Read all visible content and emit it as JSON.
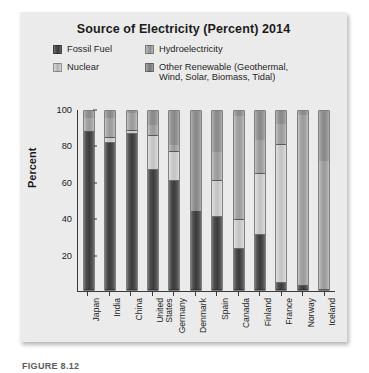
{
  "figure": {
    "caption_fragment": "FIGURE 8.12"
  },
  "chart_data": {
    "type": "bar",
    "subtype": "stacked-bar",
    "title": "Source of Electricity (Percent) 2014",
    "xlabel": "",
    "ylabel": "Percent",
    "ylim": [
      0,
      100
    ],
    "yticks": [
      20,
      40,
      60,
      80,
      100
    ],
    "ytick_labels": [
      "20",
      "40",
      "60",
      "80",
      "100"
    ],
    "grid": false,
    "legend_position": "top",
    "categories": [
      "Japan",
      "India",
      "China",
      "United\nStates",
      "Germany",
      "Denmark",
      "Spain",
      "Canada",
      "Finland",
      "France",
      "Norway",
      "Iceland"
    ],
    "series": [
      {
        "name": "Fossil Fuel",
        "color": "#3f3f3f",
        "values": [
          88,
          82,
          87,
          67,
          61,
          44,
          41,
          23,
          31,
          4,
          2,
          0
        ]
      },
      {
        "name": "Nuclear",
        "color": "#c7c7c7",
        "values": [
          0,
          3,
          2,
          19,
          16,
          0,
          20,
          16,
          34,
          77,
          0,
          0
        ]
      },
      {
        "name": "Hydroelectricity",
        "color": "#9e9e9e",
        "values": [
          8,
          11,
          10,
          6,
          4,
          0,
          16,
          58,
          19,
          12,
          96,
          72
        ]
      },
      {
        "name": "Other Renewable (Geothermal, Wind, Solar, Biomass, Tidal)",
        "color": "#8b8b8b",
        "values": [
          4,
          4,
          1,
          8,
          19,
          56,
          23,
          3,
          16,
          7,
          2,
          28
        ]
      }
    ],
    "legend": [
      {
        "label": "Fossil Fuel",
        "swatch": "sw-fossil"
      },
      {
        "label": "Nuclear",
        "swatch": "sw-nuclear"
      },
      {
        "label": "Hydroelectricity",
        "swatch": "sw-hydro"
      },
      {
        "label": "Other Renewable (Geothermal,\nWind, Solar, Biomass, Tidal)",
        "swatch": "sw-other"
      }
    ]
  }
}
